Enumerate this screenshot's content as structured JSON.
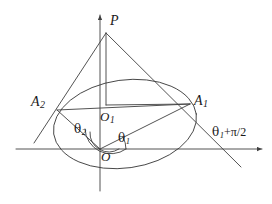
{
  "figure": {
    "kind": "geometry-diagram",
    "background_color": "#ffffff",
    "stroke_color": "#3f3f3f",
    "text_color": "#1a1a1a"
  },
  "labels": {
    "apex": "P",
    "tangent_point_left": "A",
    "tangent_point_left_sub": "2",
    "tangent_point_right": "A",
    "tangent_point_right_sub": "1",
    "ellipse_center": "O",
    "ellipse_center_sub": "1",
    "origin": "O",
    "angle_left": "θ",
    "angle_left_sub": "2",
    "angle_right": "θ",
    "angle_right_sub": "1",
    "axis_right": "θ",
    "axis_right_sub": "1",
    "axis_right_tail": "+π/2"
  },
  "geometry": {
    "origin": {
      "x": 100,
      "y": 149
    },
    "apex": {
      "x": 106,
      "y": 33
    },
    "ellipse_center": {
      "x": 125,
      "y": 124
    },
    "ellipse_rx": 72,
    "ellipse_ry": 44,
    "ellipse_rotation_deg": -8,
    "tangent_point_left": {
      "x": 57,
      "y": 110
    },
    "tangent_point_right": {
      "x": 190,
      "y": 104
    },
    "x_axis": {
      "x1": 16,
      "y1": 149,
      "x2": 266,
      "y2": 149
    },
    "y_axis": {
      "x1": 100,
      "y1": 191,
      "x2": 100,
      "y2": 11
    },
    "tangent_left_extent": {
      "x": 34,
      "y": 143
    },
    "tangent_right_extent": {
      "x": 241,
      "y": 167
    },
    "foot_O1": {
      "x": 106,
      "y": 105
    },
    "angle_arc_radius_inner": 18,
    "angle_arc_radius_outer": 25
  }
}
